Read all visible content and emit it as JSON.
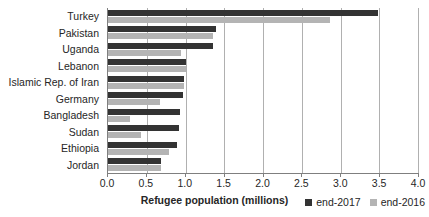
{
  "chart_data": {
    "type": "bar",
    "orientation": "horizontal",
    "title": "",
    "xlabel": "Refugee population (millions)",
    "ylabel": "",
    "xlim": [
      0.0,
      4.0
    ],
    "xticks": [
      "0.0",
      "0.5",
      "1.0",
      "1.5",
      "2.0",
      "2.5",
      "3.0",
      "3.5",
      "4.0"
    ],
    "xtick_values": [
      0.0,
      0.5,
      1.0,
      1.5,
      2.0,
      2.5,
      3.0,
      3.5,
      4.0
    ],
    "grid": true,
    "legend_position": "bottom-right",
    "categories": [
      "Turkey",
      "Pakistan",
      "Uganda",
      "Lebanon",
      "Islamic Rep. of Iran",
      "Germany",
      "Bangladesh",
      "Sudan",
      "Ethiopia",
      "Jordan"
    ],
    "series": [
      {
        "name": "end-2017",
        "color": "#333333",
        "values": [
          3.48,
          1.39,
          1.35,
          1.0,
          0.98,
          0.97,
          0.93,
          0.91,
          0.89,
          0.69
        ]
      },
      {
        "name": "end-2016",
        "color": "#b4b4b4",
        "values": [
          2.87,
          1.35,
          0.94,
          1.01,
          0.98,
          0.67,
          0.28,
          0.42,
          0.79,
          0.69
        ]
      }
    ]
  },
  "legend": {
    "items": [
      {
        "label": "end-2017",
        "swatch": "series-0-swatch"
      },
      {
        "label": "end-2016",
        "swatch": "series-1-swatch"
      }
    ]
  }
}
